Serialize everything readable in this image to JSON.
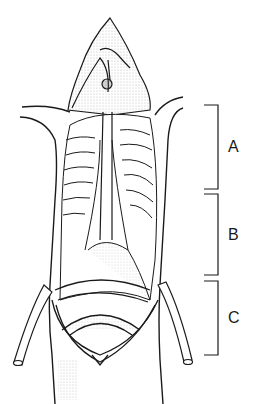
{
  "figure": {
    "type": "anatomical line illustration",
    "brackets": [
      {
        "label": "A",
        "top": 105,
        "bottom": 189
      },
      {
        "label": "B",
        "top": 194,
        "bottom": 275
      },
      {
        "label": "C",
        "top": 281,
        "bottom": 355
      }
    ]
  },
  "colors": {
    "ink": "#1a1a1a",
    "stipple": "#555555",
    "background": "#ffffff"
  }
}
